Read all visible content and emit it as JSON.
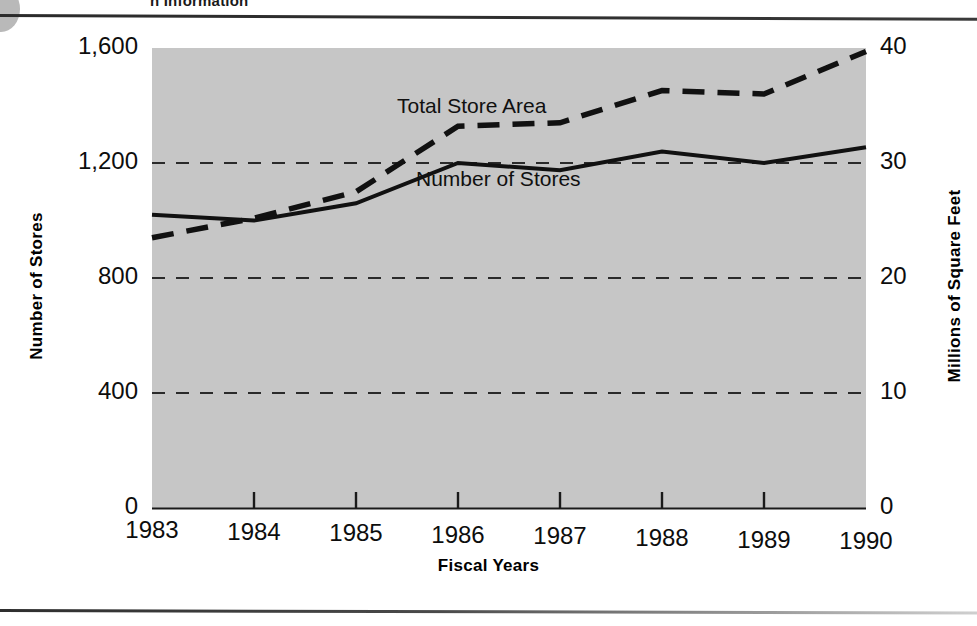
{
  "page": {
    "clipped_header_title": "n Information",
    "background_color": "#ffffff"
  },
  "figure": {
    "plot_background_color": "#c6c6c6",
    "series_color": "#111111",
    "gridline_color": "#2a2a2a"
  },
  "chart_data": {
    "type": "line",
    "title": "",
    "subtitle": "",
    "xlabel": "Fiscal Years",
    "ylabel": "Number of Stores",
    "y2label": "Millions of Square Feet",
    "categories": [
      "1983",
      "1984",
      "1985",
      "1986",
      "1987",
      "1988",
      "1989",
      "1990"
    ],
    "x": [
      1983,
      1984,
      1985,
      1986,
      1987,
      1988,
      1989,
      1990
    ],
    "ylim": [
      0,
      1600
    ],
    "y2lim": [
      0,
      40
    ],
    "yticks": [
      "0",
      "400",
      "800",
      "1,200",
      "1,600"
    ],
    "ytick_values": [
      0,
      400,
      800,
      1200,
      1600
    ],
    "y2ticks": [
      "0",
      "10",
      "20",
      "30",
      "40"
    ],
    "y2tick_values": [
      0,
      10,
      20,
      30,
      40
    ],
    "grid": "horizontal-dashed",
    "gridline_values": [
      400,
      800,
      1200
    ],
    "legend": "inline-annotations",
    "series": [
      {
        "name": "Number of Stores",
        "axis": "left",
        "style": "solid",
        "values": [
          1020,
          1000,
          1060,
          1200,
          1175,
          1240,
          1200,
          1255
        ]
      },
      {
        "name": "Total Store Area",
        "axis": "right",
        "style": "dashed",
        "values": [
          23.5,
          25.2,
          27.5,
          33.2,
          33.5,
          36.3,
          36.0,
          39.7
        ]
      }
    ],
    "annotations": [
      {
        "text": "Total Store Area",
        "series": "Total Store Area"
      },
      {
        "text": "Number of Stores",
        "series": "Number of Stores"
      }
    ]
  }
}
